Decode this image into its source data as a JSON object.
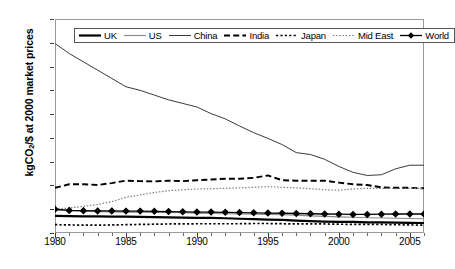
{
  "chart_data": {
    "type": "line",
    "title": "",
    "xlabel": "",
    "ylabel": "kgCO2/$ at 2000 market prices",
    "ylabel_prefix": "kgCO",
    "ylabel_sub": "2",
    "ylabel_suffix": "/$ at 2000 market prices",
    "xlim": [
      1980,
      2006
    ],
    "ylim": [
      0.0,
      9.0
    ],
    "ytick_labels": [
      "0.00",
      "1.00",
      "2.00",
      "3.00",
      "4.00",
      "5.00",
      "6.00",
      "7.00",
      "8.00",
      "9.00"
    ],
    "ytick_values": [
      0,
      1,
      2,
      3,
      4,
      5,
      6,
      7,
      8,
      9
    ],
    "xtick_labels": [
      "1980",
      "1985",
      "1990",
      "1995",
      "2000",
      "2005"
    ],
    "xtick_values": [
      1980,
      1985,
      1990,
      1995,
      2000,
      2005
    ],
    "xtick_minor_values": [
      1981,
      1982,
      1983,
      1984,
      1986,
      1987,
      1988,
      1989,
      1991,
      1992,
      1993,
      1994,
      1996,
      1997,
      1998,
      1999,
      2001,
      2002,
      2003,
      2004,
      2006
    ],
    "grid": false,
    "legend_position": "top-center-inside",
    "x": [
      1980,
      1981,
      1982,
      1983,
      1984,
      1985,
      1986,
      1987,
      1988,
      1989,
      1990,
      1991,
      1992,
      1993,
      1994,
      1995,
      1996,
      1997,
      1998,
      1999,
      2000,
      2001,
      2002,
      2003,
      2004,
      2005,
      2006
    ],
    "series": [
      {
        "name": "UK",
        "style": "thick-solid",
        "color": "#000000",
        "values": [
          0.72,
          0.71,
          0.7,
          0.7,
          0.69,
          0.69,
          0.68,
          0.67,
          0.66,
          0.65,
          0.64,
          0.64,
          0.62,
          0.6,
          0.58,
          0.56,
          0.55,
          0.52,
          0.5,
          0.48,
          0.47,
          0.47,
          0.45,
          0.45,
          0.44,
          0.43,
          0.42
        ]
      },
      {
        "name": "US",
        "style": "thin-solid-gray",
        "color": "#888888",
        "values": [
          0.96,
          0.94,
          0.92,
          0.9,
          0.89,
          0.88,
          0.87,
          0.86,
          0.86,
          0.85,
          0.83,
          0.82,
          0.81,
          0.8,
          0.79,
          0.78,
          0.77,
          0.75,
          0.72,
          0.7,
          0.68,
          0.66,
          0.64,
          0.63,
          0.62,
          0.61,
          0.6
        ]
      },
      {
        "name": "China",
        "style": "thin-solid",
        "color": "#3a3a3a",
        "values": [
          7.97,
          7.55,
          7.2,
          6.85,
          6.5,
          6.15,
          6.0,
          5.8,
          5.6,
          5.45,
          5.3,
          5.02,
          4.8,
          4.5,
          4.22,
          3.98,
          3.72,
          3.38,
          3.3,
          3.1,
          2.8,
          2.55,
          2.42,
          2.45,
          2.7,
          2.85,
          2.85
        ]
      },
      {
        "name": "India",
        "style": "dashed",
        "color": "#000000",
        "values": [
          1.9,
          2.05,
          2.05,
          2.02,
          2.1,
          2.2,
          2.18,
          2.17,
          2.2,
          2.18,
          2.22,
          2.25,
          2.28,
          2.28,
          2.32,
          2.42,
          2.22,
          2.2,
          2.2,
          2.2,
          2.12,
          2.05,
          2.02,
          1.92,
          1.9,
          1.9,
          1.88
        ]
      },
      {
        "name": "Japan",
        "style": "dotted-thick",
        "color": "#000000",
        "values": [
          0.35,
          0.34,
          0.33,
          0.33,
          0.34,
          0.35,
          0.36,
          0.37,
          0.38,
          0.38,
          0.39,
          0.39,
          0.39,
          0.39,
          0.4,
          0.4,
          0.39,
          0.38,
          0.38,
          0.38,
          0.37,
          0.36,
          0.36,
          0.36,
          0.35,
          0.34,
          0.33
        ]
      },
      {
        "name": "Mid East",
        "style": "dotted-fine",
        "color": "#777777",
        "values": [
          1.0,
          1.05,
          1.12,
          1.2,
          1.32,
          1.5,
          1.6,
          1.7,
          1.78,
          1.82,
          1.85,
          1.86,
          1.88,
          1.9,
          1.92,
          1.95,
          1.92,
          1.9,
          1.86,
          1.82,
          1.8,
          1.85,
          1.88,
          1.88,
          1.87,
          1.88,
          1.88
        ]
      },
      {
        "name": "World",
        "style": "solid-diamond",
        "color": "#000000",
        "values": [
          1.0,
          0.95,
          0.94,
          0.93,
          0.93,
          0.92,
          0.92,
          0.91,
          0.9,
          0.89,
          0.88,
          0.88,
          0.87,
          0.86,
          0.85,
          0.84,
          0.83,
          0.82,
          0.81,
          0.8,
          0.79,
          0.78,
          0.78,
          0.79,
          0.8,
          0.8,
          0.8
        ]
      }
    ]
  },
  "legend": {
    "entries": [
      {
        "label": "UK",
        "style": "thick-solid"
      },
      {
        "label": "US",
        "style": "thin-solid-gray"
      },
      {
        "label": "China",
        "style": "thin-solid"
      },
      {
        "label": "India",
        "style": "dashed"
      },
      {
        "label": "Japan",
        "style": "dotted-thick"
      },
      {
        "label": "Mid East",
        "style": "dotted-fine"
      },
      {
        "label": "World",
        "style": "solid-diamond"
      }
    ]
  },
  "colors": {
    "frame": "#9a9a9a",
    "axis_text": "#000000",
    "us_gray": "#888888",
    "mideast_gray": "#777777",
    "china_gray": "#3a3a3a"
  }
}
